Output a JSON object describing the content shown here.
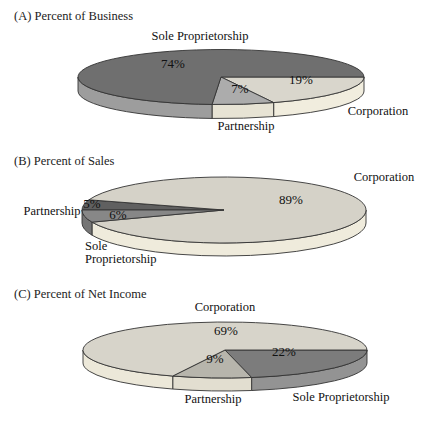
{
  "figure_background": "#ffffff",
  "outline_color": "#333333",
  "text_color": "#111111",
  "chart_data": [
    {
      "id": "A",
      "type": "pie",
      "title": "(A) Percent of Business",
      "unit": "%",
      "categories": [
        "Corporation",
        "Partnership",
        "Sole Proprietorship"
      ],
      "values": [
        19,
        7,
        74
      ],
      "slices": [
        {
          "label": "Corporation",
          "value": 19,
          "pct_label": "19%",
          "top_color": "#d9d6cc",
          "side_color": "#f1edde",
          "pct_pos": {
            "x": 301,
            "y": 81
          },
          "name_label": {
            "x": 378,
            "y": 112,
            "anchor": "middle",
            "lines": [
              "Corporation"
            ]
          }
        },
        {
          "label": "Partnership",
          "value": 7,
          "pct_label": "7%",
          "top_color": "#acacac",
          "side_color": "#e7e3d4",
          "pct_pos": {
            "x": 240,
            "y": 90
          },
          "name_label": {
            "x": 246,
            "y": 127,
            "anchor": "middle",
            "lines": [
              "Partnership"
            ]
          }
        },
        {
          "label": "Sole Proprietorship",
          "value": 74,
          "pct_label": "74%",
          "top_color": "#6f6f6f",
          "side_color": "#9d9d9d",
          "pct_pos": {
            "x": 173,
            "y": 65
          },
          "name_label": {
            "x": 200,
            "y": 37,
            "anchor": "middle",
            "lines": [
              "Sole Proprietorship"
            ]
          }
        }
      ],
      "layout": {
        "cx": 221,
        "cy": 77,
        "rx": 143,
        "ry": 27.5,
        "depth": 14,
        "start_deg": 0
      }
    },
    {
      "id": "B",
      "type": "pie",
      "title": "(B) Percent of Sales",
      "unit": "%",
      "categories": [
        "Partnership",
        "Corporation",
        "Sole Proprietorship"
      ],
      "values": [
        5,
        89,
        6
      ],
      "slices": [
        {
          "label": "Partnership",
          "value": 5,
          "pct_label": "5%",
          "top_color": "#606060",
          "side_color": "#606060",
          "pct_pos": {
            "x": 92,
            "y": 205
          },
          "name_label": {
            "x": 52,
            "y": 212,
            "anchor": "middle",
            "lines": [
              "Partnership"
            ]
          }
        },
        {
          "label": "Corporation",
          "value": 89,
          "pct_label": "89%",
          "top_color": "#d5d2c8",
          "side_color": "#efebdc",
          "pct_pos": {
            "x": 291,
            "y": 201
          },
          "name_label": {
            "x": 384,
            "y": 178,
            "anchor": "middle",
            "lines": [
              "Corporation"
            ]
          }
        },
        {
          "label": "Sole Proprietorship",
          "value": 6,
          "pct_label": "6%",
          "top_color": "#878787",
          "side_color": "#757575",
          "pct_pos": {
            "x": 118,
            "y": 216
          },
          "name_label": {
            "x": 85,
            "y": 247,
            "anchor": "start",
            "lines": [
              "Sole",
              "Proprietorship"
            ]
          }
        }
      ],
      "layout": {
        "cx": 224,
        "cy": 210,
        "rx": 142,
        "ry": 33,
        "depth": 13,
        "start_deg": 180
      }
    },
    {
      "id": "C",
      "type": "pie",
      "title": "(C) Percent of Net Income",
      "unit": "%",
      "categories": [
        "Sole Proprietorship",
        "Partnership",
        "Corporation"
      ],
      "values": [
        22,
        9,
        69
      ],
      "slices": [
        {
          "label": "Sole Proprietorship",
          "value": 22,
          "pct_label": "22%",
          "top_color": "#7c7c7c",
          "side_color": "#939393",
          "pct_pos": {
            "x": 284,
            "y": 353
          },
          "name_label": {
            "x": 341,
            "y": 398,
            "anchor": "middle",
            "lines": [
              "Sole Proprietorship"
            ]
          }
        },
        {
          "label": "Partnership",
          "value": 9,
          "pct_label": "9%",
          "top_color": "#b7b5ac",
          "side_color": "#e2ded0",
          "pct_pos": {
            "x": 215,
            "y": 360
          },
          "name_label": {
            "x": 213,
            "y": 400,
            "anchor": "middle",
            "lines": [
              "Partnership"
            ]
          }
        },
        {
          "label": "Corporation",
          "value": 69,
          "pct_label": "69%",
          "top_color": "#d7d4ca",
          "side_color": "#ece8d9",
          "pct_pos": {
            "x": 226,
            "y": 332
          },
          "name_label": {
            "x": 225,
            "y": 308,
            "anchor": "middle",
            "lines": [
              "Corporation"
            ]
          }
        }
      ],
      "layout": {
        "cx": 225,
        "cy": 350,
        "rx": 142,
        "ry": 28,
        "depth": 13,
        "start_deg": 0
      }
    }
  ]
}
